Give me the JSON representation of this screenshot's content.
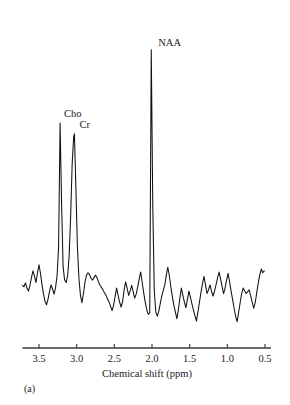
{
  "figure": {
    "panel_label": "(a)",
    "background": "#ffffff",
    "trace_color": "#111111",
    "axis_color": "#3a3a3a"
  },
  "chart_data": {
    "type": "line",
    "title": "",
    "subtitle": "",
    "xlabel": "Chemical shift (ppm)",
    "ylabel": "",
    "xlim": [
      3.72,
      0.42
    ],
    "x_axis_inverted": true,
    "ylim": [
      0,
      1
    ],
    "grid": false,
    "legend": null,
    "xticks": [
      3.5,
      3.0,
      2.5,
      2.0,
      1.5,
      1.0,
      0.5
    ],
    "xtick_labels": [
      "3.5",
      "3.0",
      "2.5",
      "2.0",
      "1.5",
      "1.0",
      "0.5"
    ],
    "yticks": [],
    "ytick_labels": [],
    "annotations": [
      {
        "text": "Cho",
        "ppm": 3.22,
        "value": 0.735,
        "label_dx": 4,
        "label_dy": -6
      },
      {
        "text": "Cr",
        "ppm": 3.03,
        "value": 0.7,
        "label_dx": 5,
        "label_dy": -6
      },
      {
        "text": "NAA",
        "ppm": 2.01,
        "value": 0.975,
        "label_dx": 7,
        "label_dy": -4
      }
    ],
    "series": [
      {
        "name": "MR spectrum",
        "x": [
          3.72,
          3.7,
          3.68,
          3.66,
          3.64,
          3.62,
          3.6,
          3.58,
          3.56,
          3.54,
          3.52,
          3.5,
          3.48,
          3.46,
          3.44,
          3.42,
          3.4,
          3.38,
          3.36,
          3.34,
          3.32,
          3.3,
          3.28,
          3.26,
          3.24,
          3.22,
          3.2,
          3.18,
          3.16,
          3.14,
          3.12,
          3.1,
          3.08,
          3.06,
          3.04,
          3.03,
          3.01,
          2.99,
          2.97,
          2.95,
          2.93,
          2.91,
          2.89,
          2.87,
          2.85,
          2.83,
          2.81,
          2.79,
          2.77,
          2.75,
          2.73,
          2.71,
          2.69,
          2.67,
          2.65,
          2.63,
          2.61,
          2.59,
          2.57,
          2.55,
          2.53,
          2.51,
          2.49,
          2.47,
          2.45,
          2.43,
          2.41,
          2.39,
          2.37,
          2.35,
          2.33,
          2.31,
          2.29,
          2.27,
          2.25,
          2.23,
          2.21,
          2.19,
          2.17,
          2.15,
          2.13,
          2.11,
          2.09,
          2.07,
          2.05,
          2.03,
          2.01,
          1.99,
          1.97,
          1.95,
          1.93,
          1.91,
          1.89,
          1.87,
          1.85,
          1.83,
          1.81,
          1.79,
          1.77,
          1.75,
          1.73,
          1.71,
          1.69,
          1.67,
          1.65,
          1.63,
          1.61,
          1.59,
          1.57,
          1.55,
          1.53,
          1.51,
          1.49,
          1.47,
          1.45,
          1.43,
          1.41,
          1.39,
          1.37,
          1.35,
          1.33,
          1.31,
          1.29,
          1.27,
          1.25,
          1.23,
          1.21,
          1.19,
          1.17,
          1.15,
          1.13,
          1.11,
          1.09,
          1.07,
          1.05,
          1.03,
          1.01,
          0.99,
          0.97,
          0.95,
          0.93,
          0.91,
          0.89,
          0.87,
          0.85,
          0.83,
          0.81,
          0.79,
          0.77,
          0.75,
          0.73,
          0.71,
          0.69,
          0.67,
          0.65,
          0.63,
          0.61,
          0.59,
          0.57,
          0.55,
          0.53,
          0.51
        ],
        "values": [
          0.205,
          0.2,
          0.213,
          0.196,
          0.186,
          0.205,
          0.23,
          0.252,
          0.236,
          0.214,
          0.246,
          0.272,
          0.243,
          0.206,
          0.176,
          0.152,
          0.141,
          0.16,
          0.186,
          0.206,
          0.192,
          0.176,
          0.198,
          0.236,
          0.33,
          0.735,
          0.47,
          0.265,
          0.222,
          0.214,
          0.236,
          0.3,
          0.43,
          0.6,
          0.69,
          0.7,
          0.52,
          0.33,
          0.228,
          0.172,
          0.148,
          0.178,
          0.214,
          0.238,
          0.246,
          0.24,
          0.228,
          0.222,
          0.23,
          0.238,
          0.23,
          0.216,
          0.205,
          0.198,
          0.19,
          0.18,
          0.172,
          0.16,
          0.15,
          0.137,
          0.122,
          0.14,
          0.168,
          0.196,
          0.172,
          0.15,
          0.134,
          0.152,
          0.19,
          0.216,
          0.196,
          0.172,
          0.186,
          0.205,
          0.184,
          0.163,
          0.176,
          0.2,
          0.226,
          0.248,
          0.214,
          0.18,
          0.15,
          0.125,
          0.11,
          0.115,
          0.975,
          0.47,
          0.19,
          0.118,
          0.104,
          0.12,
          0.146,
          0.17,
          0.188,
          0.206,
          0.238,
          0.264,
          0.236,
          0.2,
          0.168,
          0.14,
          0.118,
          0.096,
          0.125,
          0.162,
          0.196,
          0.172,
          0.15,
          0.132,
          0.158,
          0.186,
          0.166,
          0.144,
          0.124,
          0.106,
          0.088,
          0.118,
          0.15,
          0.182,
          0.21,
          0.234,
          0.206,
          0.178,
          0.19,
          0.206,
          0.186,
          0.17,
          0.186,
          0.206,
          0.228,
          0.248,
          0.226,
          0.202,
          0.178,
          0.196,
          0.222,
          0.244,
          0.216,
          0.186,
          0.158,
          0.13,
          0.104,
          0.086,
          0.116,
          0.148,
          0.178,
          0.196,
          0.186,
          0.178,
          0.184,
          0.19,
          0.17,
          0.15,
          0.13,
          0.148,
          0.18,
          0.212,
          0.238,
          0.258,
          0.246,
          0.252
        ]
      }
    ]
  }
}
